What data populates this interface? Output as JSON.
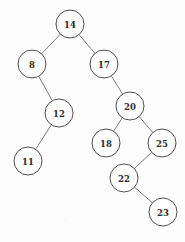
{
  "diagram": {
    "type": "binary-search-tree",
    "title": "",
    "canvas": {
      "width": 185,
      "height": 242
    },
    "style": {
      "background_color": "#fdfdfd",
      "node_fill": "#ffffff",
      "node_stroke": "#4f4f4f",
      "edge_stroke": "#6e6e6e",
      "label_color": "#2b2b2b",
      "node_radius": 14
    },
    "nodes": [
      {
        "id": "n14",
        "label": "14",
        "x": 70,
        "y": 24,
        "r": 14
      },
      {
        "id": "n8",
        "label": "8",
        "x": 32,
        "y": 64,
        "r": 14
      },
      {
        "id": "n17",
        "label": "17",
        "x": 104,
        "y": 64,
        "r": 14
      },
      {
        "id": "n12",
        "label": "12",
        "x": 59,
        "y": 113,
        "r": 14
      },
      {
        "id": "n20",
        "label": "20",
        "x": 130,
        "y": 106,
        "r": 14
      },
      {
        "id": "n11",
        "label": "11",
        "x": 28,
        "y": 161,
        "r": 14
      },
      {
        "id": "n18",
        "label": "18",
        "x": 106,
        "y": 143,
        "r": 14
      },
      {
        "id": "n25",
        "label": "25",
        "x": 162,
        "y": 143,
        "r": 14
      },
      {
        "id": "n22",
        "label": "22",
        "x": 124,
        "y": 178,
        "r": 14
      },
      {
        "id": "n23",
        "label": "23",
        "x": 163,
        "y": 212,
        "r": 14
      }
    ],
    "edges": [
      {
        "id": "e1",
        "from": "n14",
        "to": "n8",
        "side": "left"
      },
      {
        "id": "e2",
        "from": "n14",
        "to": "n17",
        "side": "right"
      },
      {
        "id": "e3",
        "from": "n8",
        "to": "n12",
        "side": "right"
      },
      {
        "id": "e4",
        "from": "n12",
        "to": "n11",
        "side": "left"
      },
      {
        "id": "e5",
        "from": "n17",
        "to": "n20",
        "side": "right"
      },
      {
        "id": "e6",
        "from": "n20",
        "to": "n18",
        "side": "left"
      },
      {
        "id": "e7",
        "from": "n20",
        "to": "n25",
        "side": "right"
      },
      {
        "id": "e8",
        "from": "n25",
        "to": "n22",
        "side": "left"
      },
      {
        "id": "e9",
        "from": "n22",
        "to": "n23",
        "side": "right"
      }
    ]
  }
}
